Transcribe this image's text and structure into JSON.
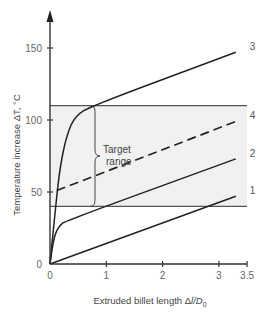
{
  "chart_data": {
    "type": "line",
    "title": "",
    "xlabel": "Extruded billet length Δl/D0",
    "xlabel_parts": {
      "main": "Extruded billet length Δ",
      "italic": "l/D",
      "sub": "0"
    },
    "ylabel": "Temperature increase ΔT, °C",
    "xlim": [
      0,
      3.5
    ],
    "ylim": [
      0,
      170
    ],
    "x_ticks": [
      0,
      1,
      2,
      3,
      3.5
    ],
    "x_tick_labels": [
      "0",
      "1",
      "2",
      "3",
      "3.5"
    ],
    "y_ticks": [
      0,
      50,
      100,
      150
    ],
    "y_tick_labels": [
      "0",
      "50",
      "100",
      "150"
    ],
    "grid": false,
    "legend": "inline labels at line ends",
    "target_range": {
      "label_line1": "Target",
      "label_line2": "range",
      "lower": 40,
      "upper": 110,
      "x_start": 0,
      "x_end": 3.5,
      "fill": "#f1f1f1"
    },
    "series": [
      {
        "name": "1",
        "style": "solid",
        "points": [
          [
            0,
            0
          ],
          [
            3.3,
            47
          ]
        ]
      },
      {
        "name": "2",
        "style": "solid",
        "points": [
          [
            0,
            0
          ],
          [
            0.04,
            12
          ],
          [
            0.1,
            22
          ],
          [
            0.18,
            27
          ],
          [
            0.28,
            30
          ],
          [
            3.3,
            73
          ]
        ]
      },
      {
        "name": "3",
        "style": "solid",
        "points": [
          [
            0,
            0
          ],
          [
            0.1,
            40
          ],
          [
            0.18,
            68
          ],
          [
            0.3,
            90
          ],
          [
            0.45,
            103
          ],
          [
            0.75,
            110
          ],
          [
            3.3,
            147
          ]
        ]
      },
      {
        "name": "4",
        "style": "dashed",
        "points": [
          [
            0.12,
            51
          ],
          [
            3.3,
            99
          ]
        ]
      }
    ]
  }
}
